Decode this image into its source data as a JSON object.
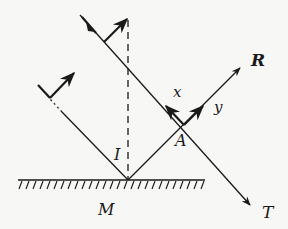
{
  "diagram": {
    "type": "reflection-coordinate-diagram",
    "labels": {
      "x": "x",
      "y": "y",
      "I": "I",
      "A": "A",
      "M": "M",
      "R": "R",
      "T": "T"
    },
    "colors": {
      "ink": "#1a1a1a",
      "background": "#f7f7f5"
    }
  }
}
